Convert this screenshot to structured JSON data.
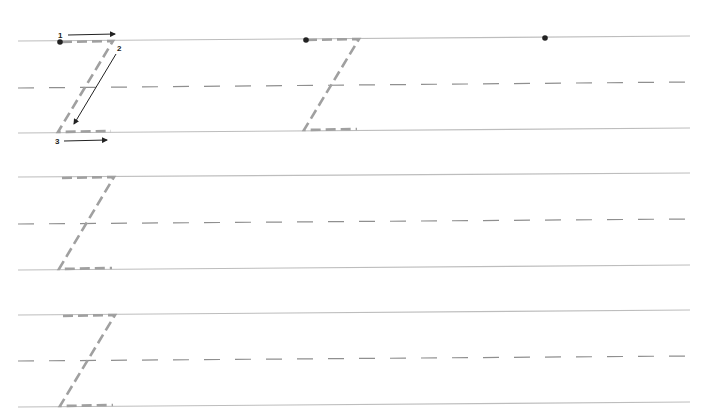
{
  "worksheet": {
    "letter": "Z",
    "colors": {
      "rule": "#bdbdbd",
      "dash": "#8f8f8f",
      "trace": "#a0a0a0",
      "ink": "#222222"
    },
    "rows": [
      {
        "top": 41,
        "mid": 88,
        "base": 133,
        "slope": -5
      },
      {
        "top": 177,
        "mid": 224,
        "base": 270,
        "slope": -5
      },
      {
        "top": 315,
        "mid": 361,
        "base": 407,
        "slope": -5
      }
    ],
    "stroke_labels": [
      "1",
      "2",
      "3"
    ]
  }
}
